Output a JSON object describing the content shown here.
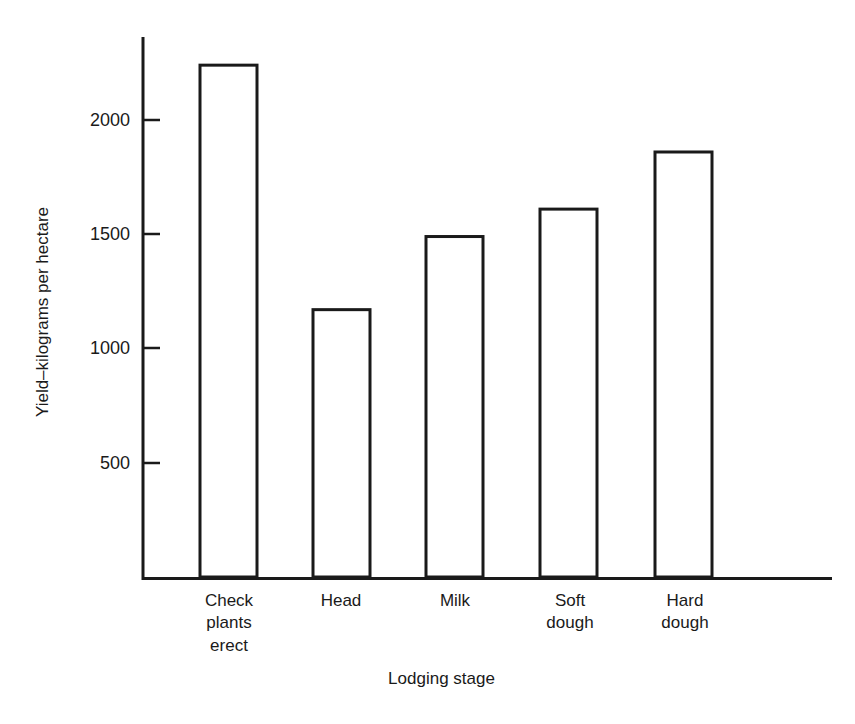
{
  "chart_data": {
    "type": "bar",
    "title": "",
    "xlabel": "Lodging stage",
    "ylabel": "Yield–kilograms per hectare",
    "categories": [
      "Check\nplants\nerect",
      "Head",
      "Milk",
      "Soft\ndough",
      "Hard\ndough"
    ],
    "values": [
      2240,
      1170,
      1490,
      1610,
      1860
    ],
    "ylim": [
      0,
      2400
    ],
    "yticks": [
      500,
      1000,
      1500,
      2000
    ],
    "ytick_labels": [
      "500",
      "1000",
      "1500",
      "2000"
    ],
    "grid": false,
    "legend": null,
    "bar_style": {
      "fill": "#ffffff",
      "edge": "#1a1a1a",
      "edge_width": 3
    },
    "axis_color": "#1a1a1a"
  },
  "figure": {
    "background": "#ffffff"
  }
}
